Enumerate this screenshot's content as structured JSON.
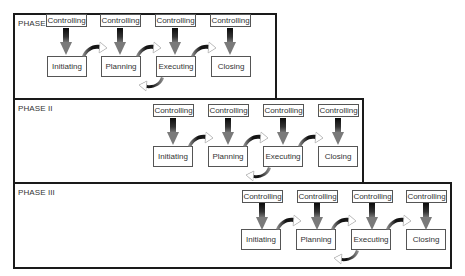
{
  "diagram": {
    "type": "process-phases",
    "phases": [
      {
        "label": "PHASE I",
        "controlling": [
          "Controlling",
          "Controlling",
          "Controlling",
          "Controlling"
        ],
        "steps": [
          "Initiating",
          "Planning",
          "Executing",
          "Closing"
        ]
      },
      {
        "label": "PHASE II",
        "controlling": [
          "Controlling",
          "Controlling",
          "Controlling",
          "Controlling"
        ],
        "steps": [
          "Initiating",
          "Planning",
          "Executing",
          "Closing"
        ]
      },
      {
        "label": "PHASE III",
        "controlling": [
          "Controlling",
          "Controlling",
          "Controlling",
          "Controlling"
        ],
        "steps": [
          "Initiating",
          "Planning",
          "Executing",
          "Closing"
        ]
      }
    ],
    "arrows": {
      "vertical": "controlling-to-step (down)",
      "forward": "step-to-next-step (curved right)",
      "feedback": "executing-to-planning (curved back)"
    },
    "colors": {
      "border": "#1a1a1a",
      "box_border": "#555555",
      "text": "#333333",
      "arrow_dark": "#111111",
      "arrow_light": "#888888"
    }
  }
}
